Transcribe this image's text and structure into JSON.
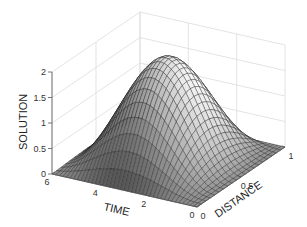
{
  "chart_data": {
    "type": "surface3d",
    "title": "",
    "xlabel": "DISTANCE",
    "ylabel": "TIME",
    "zlabel": "SOLUTION",
    "xlim": [
      0,
      1
    ],
    "ylim": [
      0,
      6
    ],
    "zlim": [
      0,
      2
    ],
    "xticks": [
      {
        "v": 0,
        "label": "0"
      },
      {
        "v": 0.5,
        "label": "0.5"
      },
      {
        "v": 1,
        "label": "1"
      }
    ],
    "yticks": [
      {
        "v": 0,
        "label": "0"
      },
      {
        "v": 2,
        "label": "2"
      },
      {
        "v": 4,
        "label": "4"
      },
      {
        "v": 6,
        "label": "6"
      }
    ],
    "zticks": [
      {
        "v": 0,
        "label": "0"
      },
      {
        "v": 0.5,
        "label": "0.5"
      },
      {
        "v": 1,
        "label": "1"
      },
      {
        "v": 1.5,
        "label": "1.5"
      },
      {
        "v": 2,
        "label": "2"
      }
    ],
    "grid": true,
    "colormap": "gray",
    "surface": {
      "description": "u(x,t) = 1 + sin(pi*x) * cos-wave in time; two crests along time, zero at x=0 and x=1",
      "x_samples": 20,
      "t_samples": 40,
      "formula": "sin(pi*x) * (1 + cos(t*1.0 + 3.14159)) + 0"
    }
  }
}
